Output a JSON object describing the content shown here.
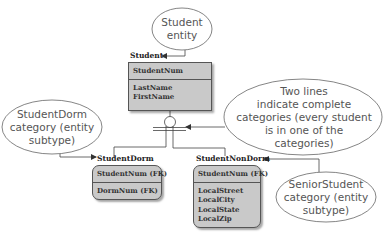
{
  "diagram": {
    "type": "ER diagram with category (subtype) relationship",
    "entities": [
      {
        "name": "Student",
        "keys": [
          "StudentNum"
        ],
        "attributes": [
          "LastName",
          "FirstName"
        ]
      },
      {
        "name": "StudentDorm",
        "keys": [
          "StudentNum (FK)"
        ],
        "attributes": [
          "DormNum (FK)"
        ]
      },
      {
        "name": "StudentNonDorm",
        "keys": [
          "StudentNum (FK)"
        ],
        "attributes": [
          "LocalStreet",
          "LocalCity",
          "LocalState",
          "LocalZip"
        ]
      }
    ],
    "callouts": {
      "student_entity": "Student entity",
      "student_dorm": "StudentDorm category (entity subtype)",
      "complete_categories": "Two lines indicate complete categories (every student is in one of the categories)",
      "senior_student": "SeniorStudent category (entity subtype)"
    },
    "callout_lines": {
      "student_entity": [
        "Student",
        "entity"
      ],
      "student_dorm": [
        "StudentDorm",
        "category (entity",
        "subtype)"
      ],
      "complete_categories": [
        "Two lines",
        "indicate complete",
        "categories (every student",
        "is in one of the",
        "categories)"
      ],
      "senior_student": [
        "SeniorStudent",
        "category (entity",
        "subtype)"
      ]
    },
    "relationships": [
      {
        "from": "Student",
        "to": "StudentDorm",
        "type": "complete category"
      },
      {
        "from": "Student",
        "to": "StudentNonDorm",
        "type": "complete category"
      }
    ],
    "colors": {
      "entity_fill": "#c9c9c9",
      "line": "#444444",
      "callout_text": "#555555"
    }
  }
}
